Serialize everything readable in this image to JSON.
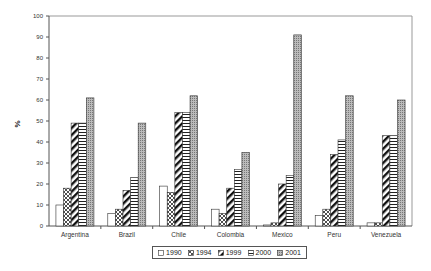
{
  "chart_data": {
    "type": "bar",
    "title": "",
    "xlabel": "",
    "ylabel": "%",
    "ylim": [
      0,
      100
    ],
    "yticks": [
      0,
      10,
      20,
      30,
      40,
      50,
      60,
      70,
      80,
      90,
      100
    ],
    "grid": false,
    "legend_position": "bottom",
    "categories": [
      "Argentina",
      "Brazil",
      "Chile",
      "Colombia",
      "Mexico",
      "Peru",
      "Venezuela"
    ],
    "series": [
      {
        "name": "1990",
        "pattern": "blank",
        "values": [
          10,
          6,
          19,
          8,
          0.5,
          5,
          1.5
        ]
      },
      {
        "name": "1994",
        "pattern": "crosshatch",
        "values": [
          18,
          8,
          16,
          6,
          1.5,
          8,
          1.5
        ]
      },
      {
        "name": "1999",
        "pattern": "diagonal",
        "values": [
          49,
          17,
          54,
          18,
          20,
          34,
          43
        ]
      },
      {
        "name": "2000",
        "pattern": "horizontal",
        "values": [
          49,
          23,
          54,
          27,
          24,
          41,
          43
        ]
      },
      {
        "name": "2001",
        "pattern": "dotted",
        "values": [
          61,
          49,
          62,
          35,
          91,
          62,
          60
        ]
      }
    ]
  }
}
